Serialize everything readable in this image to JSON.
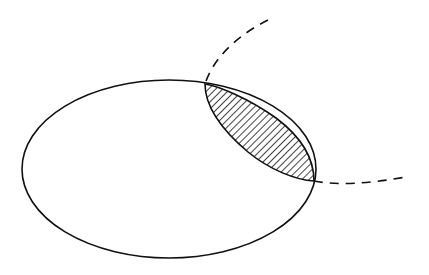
{
  "diagram": {
    "type": "set-intersection",
    "background": "#ffffff",
    "stroke_color": "#111111",
    "shapes": [
      {
        "name": "solid-ellipse",
        "style": "solid",
        "cx": 169,
        "cy": 169,
        "rx": 147,
        "ry": 89
      },
      {
        "name": "dashed-ellipse",
        "style": "dashed",
        "partially_visible": true
      }
    ],
    "intersection": {
      "fill": "hatched",
      "hatch_angle_deg": 45
    }
  }
}
